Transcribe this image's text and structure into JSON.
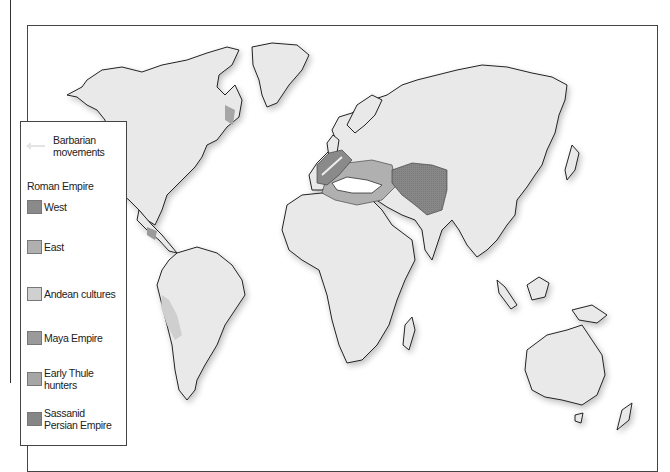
{
  "map": {
    "title": "World map: Roman Empire, Sassanid Persia and contemporary cultures",
    "colors": {
      "land": "#e9e9e9",
      "coast": "#222222",
      "roman_west": "#8a8a8a",
      "roman_east": "#b0b0b0",
      "andean": "#d0d0d0",
      "maya": "#9a9a9a",
      "thule": "#a6a6a6",
      "sassanid": "#868686",
      "barbarian_arrow": "#e4e4e4"
    }
  },
  "legend": {
    "barbarian": {
      "label_line1": "Barbarian",
      "label_line2": "movements",
      "icon": "arrow-left-icon"
    },
    "roman_heading": "Roman Empire",
    "items": [
      {
        "label": "West",
        "color": "#8a8a8a"
      },
      {
        "label": "East",
        "color": "#b0b0b0"
      },
      {
        "label": "Andean cultures",
        "color": "#d0d0d0"
      },
      {
        "label": "Maya Empire",
        "color": "#9a9a9a"
      },
      {
        "label_line1": "Early Thule",
        "label_line2": "hunters",
        "color": "#a6a6a6"
      },
      {
        "label_line1": "Sassanid",
        "label_line2": "Persian Empire",
        "color": "#868686"
      }
    ]
  }
}
